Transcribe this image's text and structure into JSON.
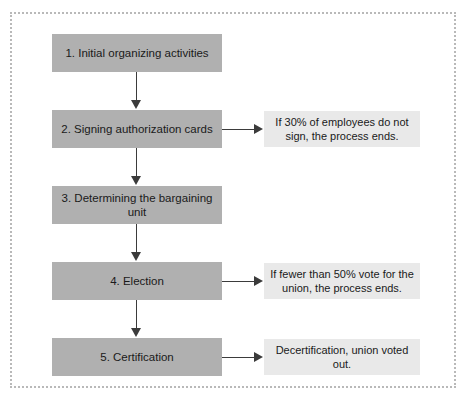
{
  "diagram": {
    "colors": {
      "step_fill": "#b0b0b0",
      "note_fill": "#e9e9e9",
      "connector": "#3b3b3b",
      "frame_border": "#b9b9b9",
      "background": "#ffffff"
    },
    "steps": [
      {
        "label": "1. Initial organizing activities"
      },
      {
        "label": "2. Signing authorization cards"
      },
      {
        "label": "3. Determining the bargaining unit"
      },
      {
        "label": "4. Election"
      },
      {
        "label": "5. Certification"
      }
    ],
    "notes": [
      {
        "label": "If 30% of employees do not sign, the process ends."
      },
      {
        "label": "If fewer than 50% vote for the union, the process ends."
      },
      {
        "label": "Decertification, union voted out."
      }
    ]
  }
}
